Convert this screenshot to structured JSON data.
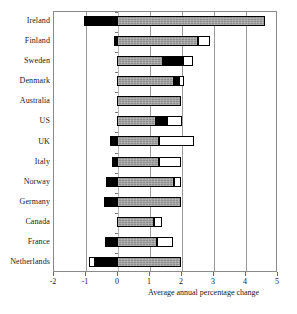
{
  "chart_data": {
    "type": "bar",
    "orientation": "horizontal",
    "stacked": true,
    "title": "",
    "subtitle": "",
    "xlabel": "Average annual percentage change",
    "ylabel": "",
    "xlim": [
      -2,
      5
    ],
    "xticks": [
      -2,
      -1,
      0,
      1,
      2,
      3,
      4,
      5
    ],
    "xticklabels": [
      "-2",
      "-1",
      "0",
      "1",
      "2",
      "3",
      "4",
      "5"
    ],
    "grid": true,
    "grid_axis": "x",
    "legend": null,
    "categories": [
      "Ireland",
      "Finland",
      "Sweden",
      "Denmark",
      "Australia",
      "US",
      "UK",
      "Italy",
      "Norway",
      "Germany",
      "Canada",
      "France",
      "Netherlands"
    ],
    "series": [
      {
        "name": "black-segment",
        "color": "#000000",
        "values": [
          -1.02,
          -0.1,
          0.6,
          0.17,
          0.0,
          0.32,
          -0.22,
          -0.16,
          -0.35,
          -0.41,
          0.0,
          -0.38,
          -0.7
        ]
      },
      {
        "name": "gray-segment",
        "color": "#8f8f8f",
        "values": [
          4.62,
          2.53,
          1.45,
          1.77,
          1.99,
          1.23,
          1.3,
          1.3,
          1.77,
          2.0,
          1.15,
          1.25,
          2.0
        ]
      },
      {
        "name": "white-segment",
        "color": "#ffffff",
        "values": [
          0.0,
          0.37,
          0.32,
          0.16,
          0.0,
          0.47,
          1.1,
          0.7,
          0.23,
          0.0,
          0.25,
          0.5,
          -0.18
        ]
      }
    ],
    "bars": [
      {
        "category": "Ireland",
        "segments": [
          {
            "fill": "black",
            "from": -1.02,
            "to": 0.0
          },
          {
            "fill": "gray",
            "from": 0.0,
            "to": 4.62
          }
        ]
      },
      {
        "category": "Finland",
        "segments": [
          {
            "fill": "black",
            "from": -0.1,
            "to": 0.0
          },
          {
            "fill": "gray",
            "from": 0.0,
            "to": 2.53
          },
          {
            "fill": "white",
            "from": 2.53,
            "to": 2.9
          }
        ]
      },
      {
        "category": "Sweden",
        "segments": [
          {
            "fill": "gray",
            "from": 0.0,
            "to": 1.45
          },
          {
            "fill": "black",
            "from": 1.45,
            "to": 2.05
          },
          {
            "fill": "white",
            "from": 2.05,
            "to": 2.37
          }
        ]
      },
      {
        "category": "Denmark",
        "segments": [
          {
            "fill": "gray",
            "from": 0.0,
            "to": 1.77
          },
          {
            "fill": "black",
            "from": 1.77,
            "to": 1.94
          },
          {
            "fill": "white",
            "from": 1.94,
            "to": 2.1
          }
        ]
      },
      {
        "category": "Australia",
        "segments": [
          {
            "fill": "gray",
            "from": 0.0,
            "to": 1.99
          }
        ]
      },
      {
        "category": "US",
        "segments": [
          {
            "fill": "gray",
            "from": 0.0,
            "to": 1.23
          },
          {
            "fill": "black",
            "from": 1.23,
            "to": 1.55
          },
          {
            "fill": "white",
            "from": 1.55,
            "to": 2.02
          }
        ]
      },
      {
        "category": "UK",
        "segments": [
          {
            "fill": "black",
            "from": -0.22,
            "to": 0.0
          },
          {
            "fill": "gray",
            "from": 0.0,
            "to": 1.3
          },
          {
            "fill": "white",
            "from": 1.3,
            "to": 2.4
          }
        ]
      },
      {
        "category": "Italy",
        "segments": [
          {
            "fill": "black",
            "from": -0.16,
            "to": 0.0
          },
          {
            "fill": "gray",
            "from": 0.0,
            "to": 1.3
          },
          {
            "fill": "white",
            "from": 1.3,
            "to": 2.0
          }
        ]
      },
      {
        "category": "Norway",
        "segments": [
          {
            "fill": "black",
            "from": -0.35,
            "to": 0.0
          },
          {
            "fill": "gray",
            "from": 0.0,
            "to": 1.77
          },
          {
            "fill": "white",
            "from": 1.77,
            "to": 2.0
          }
        ]
      },
      {
        "category": "Germany",
        "segments": [
          {
            "fill": "black",
            "from": -0.41,
            "to": 0.0
          },
          {
            "fill": "gray",
            "from": 0.0,
            "to": 2.0
          }
        ]
      },
      {
        "category": "Canada",
        "segments": [
          {
            "fill": "gray",
            "from": 0.0,
            "to": 1.15
          },
          {
            "fill": "white",
            "from": 1.15,
            "to": 1.4
          }
        ]
      },
      {
        "category": "France",
        "segments": [
          {
            "fill": "black",
            "from": -0.38,
            "to": 0.0
          },
          {
            "fill": "gray",
            "from": 0.0,
            "to": 1.25
          },
          {
            "fill": "white",
            "from": 1.25,
            "to": 1.75
          }
        ]
      },
      {
        "category": "Netherlands",
        "segments": [
          {
            "fill": "white",
            "from": -0.88,
            "to": -0.7
          },
          {
            "fill": "black",
            "from": -0.7,
            "to": 0.0
          },
          {
            "fill": "gray",
            "from": 0.0,
            "to": 2.0
          }
        ]
      }
    ]
  }
}
